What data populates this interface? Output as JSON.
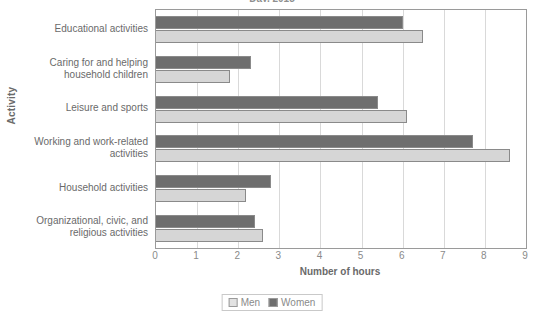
{
  "chart_data": {
    "type": "bar",
    "orientation": "horizontal",
    "title": "Day, 2015",
    "xlabel": "Number of hours",
    "ylabel": "Activity",
    "xlim": [
      0,
      9
    ],
    "xticks": [
      "0",
      "1",
      "2",
      "3",
      "4",
      "5",
      "6",
      "7",
      "8",
      "9"
    ],
    "grid": true,
    "legend_position": "bottom",
    "categories": [
      "Educational activities",
      "Caring for and helping household children",
      "Leisure and sports",
      "Working and work-related activities",
      "Household activities",
      "Organizational, civic, and religious activities"
    ],
    "series": [
      {
        "name": "Men",
        "color": "#d6d6d6",
        "values": [
          6.5,
          1.8,
          6.1,
          8.6,
          2.2,
          2.6
        ]
      },
      {
        "name": "Women",
        "color": "#6e6e6e",
        "values": [
          6.0,
          2.3,
          5.4,
          7.7,
          2.8,
          2.4
        ]
      }
    ]
  },
  "legend": {
    "items": [
      {
        "label": "Men",
        "swatch": "men-swatch"
      },
      {
        "label": "Women",
        "swatch": "women-swatch"
      }
    ]
  }
}
